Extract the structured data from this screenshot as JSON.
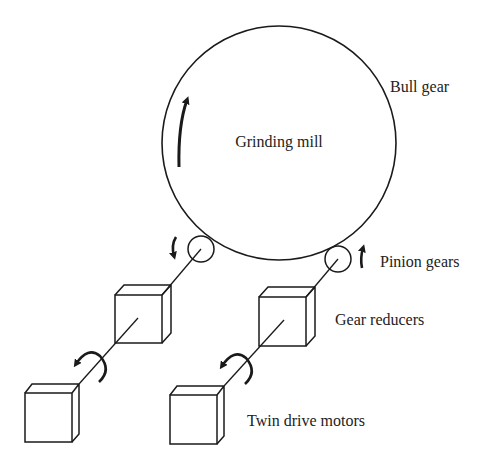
{
  "diagram": {
    "labels": {
      "mill": "Grinding mill",
      "bull_gear": "Bull gear",
      "pinion_gears": "Pinion gears",
      "gear_reducers": "Gear reducers",
      "motors": "Twin drive motors"
    },
    "components": [
      {
        "id": "grinding-mill",
        "shape": "circle",
        "label": "Grinding mill"
      },
      {
        "id": "bull-gear",
        "shape": "circle-outline",
        "label": "Bull gear"
      },
      {
        "id": "pinion-left",
        "shape": "small-circle",
        "rotation": "clockwise (down arrow)"
      },
      {
        "id": "pinion-right",
        "shape": "small-circle",
        "rotation": "up arrow"
      },
      {
        "id": "reducer-left",
        "shape": "cube"
      },
      {
        "id": "reducer-right",
        "shape": "cube"
      },
      {
        "id": "motor-left",
        "shape": "cube",
        "rotation": "curved arrow on shaft"
      },
      {
        "id": "motor-right",
        "shape": "cube",
        "rotation": "curved arrow on shaft"
      }
    ],
    "colors": {
      "line": "#1a1a1a",
      "background": "#ffffff",
      "text": "#222222"
    }
  }
}
